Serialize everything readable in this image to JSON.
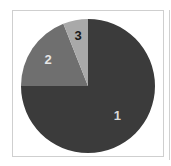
{
  "chart_data": {
    "type": "pie",
    "title": "",
    "categories": [
      "1",
      "2",
      "3"
    ],
    "values": [
      75,
      19,
      6
    ],
    "start_angle_deg": 0,
    "direction": "clockwise-from-top for slice 1; slices 2 and 3 fill counterclockwise from top",
    "colors": [
      "#3b3b3b",
      "#6f6f6f",
      "#a9a9a9"
    ],
    "label_colors": [
      "#d8d8d8",
      "#e6e6e6",
      "#1a1a1a"
    ],
    "legend": "none",
    "slice_labels_inside": true
  },
  "labels": {
    "slice1": "1",
    "slice2": "2",
    "slice3": "3"
  },
  "style": {
    "frame_border": "#cfcfcf",
    "background": "#ffffff"
  }
}
